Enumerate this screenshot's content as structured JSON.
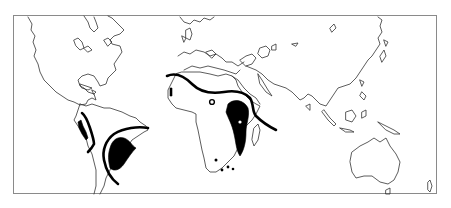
{
  "map": {
    "type": "world-outline-distribution-map",
    "projection": "equirectangular",
    "colors": {
      "coastline": "#333333",
      "frame": "#8a8a8a",
      "distribution_fill": "#000000",
      "boundary_line": "#000000",
      "background": "#ffffff"
    },
    "regions": [
      {
        "name": "north-america",
        "highlighted": false
      },
      {
        "name": "south-america",
        "highlighted": true
      },
      {
        "name": "europe",
        "highlighted": false
      },
      {
        "name": "africa",
        "highlighted": true
      },
      {
        "name": "asia",
        "highlighted": false
      },
      {
        "name": "australia",
        "highlighted": false
      }
    ],
    "features": [
      {
        "name": "africa-northern-boundary-line",
        "style": "thick-line"
      },
      {
        "name": "east-africa-distribution",
        "style": "filled"
      },
      {
        "name": "west-africa-coastal-patch",
        "style": "filled"
      },
      {
        "name": "southern-africa-spots",
        "style": "filled-dots"
      },
      {
        "name": "andes-boundary-line",
        "style": "thick-line"
      },
      {
        "name": "andes-coastal-patch",
        "style": "filled"
      },
      {
        "name": "south-america-southern-boundary",
        "style": "thick-line"
      },
      {
        "name": "paraguay-chaco-distribution",
        "style": "filled"
      }
    ]
  }
}
